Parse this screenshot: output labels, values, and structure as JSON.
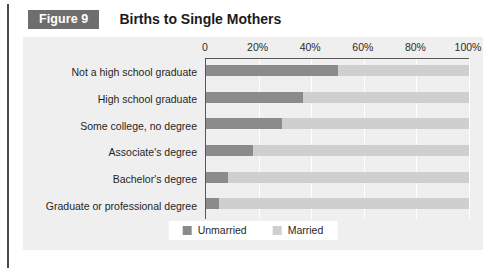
{
  "figure": {
    "badge": "Figure 9",
    "title": "Births to Single Mothers"
  },
  "legend": {
    "unmarried_label": "Unmarried",
    "married_label": "Married"
  },
  "colors": {
    "unmarried": "#8b8b8b",
    "married": "#cfcfcf",
    "panel_background": "#efefef",
    "badge_background": "#6e6e6e",
    "axis_line": "#555555",
    "gridline": "#ffffff"
  },
  "chart_data": {
    "type": "bar",
    "orientation": "horizontal",
    "stacked": true,
    "title": "Births to Single Mothers",
    "xlabel": "",
    "ylabel": "",
    "xlim": [
      0,
      100
    ],
    "xticks": [
      0,
      20,
      40,
      60,
      80,
      100
    ],
    "xtick_labels": [
      "0",
      "20%",
      "40%",
      "60%",
      "80%",
      "100%"
    ],
    "grid": true,
    "legend_position": "bottom",
    "categories": [
      "Not a high school graduate",
      "High school graduate",
      "Some college, no degree",
      "Associate's degree",
      "Bachelor's degree",
      "Graduate or professional degree"
    ],
    "series": [
      {
        "name": "Unmarried",
        "color": "#8b8b8b",
        "values": [
          50,
          37,
          29,
          18,
          8.5,
          5
        ]
      },
      {
        "name": "Married",
        "color": "#cfcfcf",
        "values": [
          50,
          63,
          71,
          82,
          91.5,
          95
        ]
      }
    ]
  }
}
